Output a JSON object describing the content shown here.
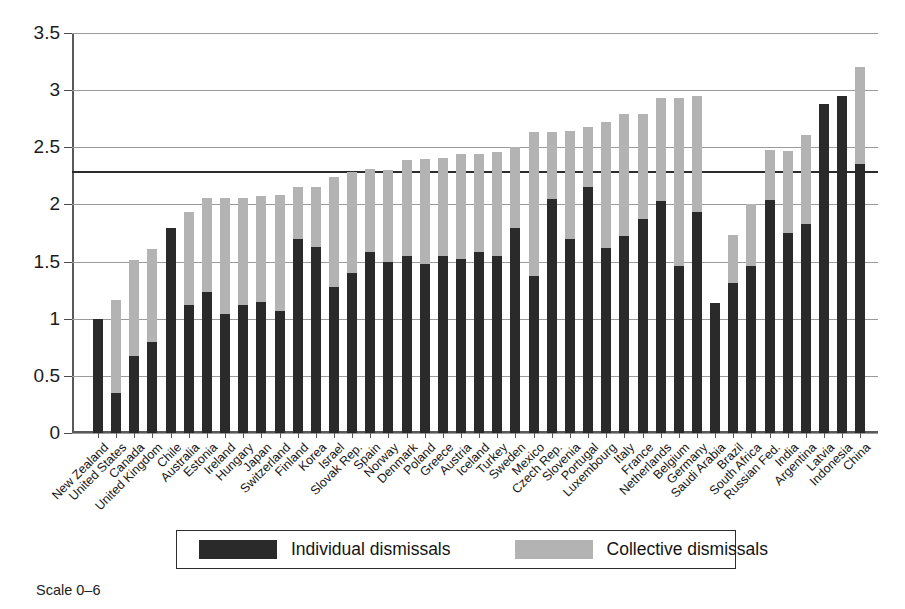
{
  "chart_data": {
    "type": "bar",
    "stacked": true,
    "title": "",
    "subtitle": "",
    "xlabel": "",
    "ylabel": "",
    "ylim": [
      0,
      3.5
    ],
    "yticks": [
      "0",
      "0.5",
      "1",
      "1.5",
      "2",
      "2.5",
      "3",
      "3.5"
    ],
    "ytick_values": [
      0,
      0.5,
      1,
      1.5,
      2,
      2.5,
      3,
      3.5
    ],
    "grid": true,
    "legend_position": "bottom",
    "reference_line": {
      "value": 2.29,
      "label": ""
    },
    "categories": [
      "New Zealand",
      "United States",
      "Canada",
      "United Kingdom",
      "Chile",
      "Australia",
      "Estonia",
      "Ireland",
      "Hungary",
      "Japan",
      "Switzerland",
      "Finland",
      "Korea",
      "Israel",
      "Slovak Rep.",
      "Spain",
      "Norway",
      "Denmark",
      "Poland",
      "Greece",
      "Austria",
      "Iceland",
      "Turkey",
      "Sweden",
      "Mexico",
      "Czech Rep.",
      "Slovenia",
      "Portugal",
      "Luxembourg",
      "Italy",
      "France",
      "Netherlands",
      "Belgium",
      "Germany",
      "Saudi Arabia",
      "Brazil",
      "South Africa",
      "Russian Fed.",
      "India",
      "Argentina",
      "Latvia",
      "Indonesia",
      "China"
    ],
    "series": [
      {
        "name": "Individual dismissals",
        "color": "#2a2a2a",
        "values": [
          1.0,
          0.35,
          0.67,
          0.8,
          1.79,
          1.12,
          1.23,
          1.04,
          1.12,
          1.15,
          1.07,
          1.7,
          1.63,
          1.28,
          1.4,
          1.58,
          1.5,
          1.55,
          1.48,
          1.55,
          1.52,
          1.58,
          1.55,
          1.79,
          1.37,
          2.05,
          1.7,
          2.15,
          1.62,
          1.72,
          1.87,
          2.03,
          1.46,
          1.93,
          1.14,
          1.31,
          1.46,
          2.04,
          1.75,
          1.83,
          2.88,
          2.95,
          2.35
        ]
      },
      {
        "name": "Collective dismissals",
        "color": "#b3b3b3",
        "values": [
          0.0,
          0.81,
          0.84,
          0.81,
          0.0,
          0.81,
          0.83,
          1.02,
          0.94,
          0.92,
          1.01,
          0.45,
          0.52,
          0.96,
          0.88,
          0.73,
          0.8,
          0.84,
          0.92,
          0.86,
          0.92,
          0.86,
          0.91,
          0.71,
          1.26,
          0.58,
          0.94,
          0.53,
          1.1,
          1.07,
          0.92,
          0.9,
          1.47,
          1.02,
          0.0,
          0.42,
          0.54,
          0.44,
          0.72,
          0.78,
          0.0,
          0.0,
          0.85
        ]
      }
    ],
    "totals": [
      1.0,
      1.16,
      1.51,
      1.61,
      1.79,
      1.93,
      2.06,
      2.06,
      2.06,
      2.07,
      2.08,
      2.15,
      2.15,
      2.24,
      2.28,
      2.31,
      2.3,
      2.39,
      2.4,
      2.41,
      2.44,
      2.44,
      2.46,
      2.5,
      2.63,
      2.63,
      2.64,
      2.68,
      2.72,
      2.79,
      2.79,
      2.93,
      2.93,
      2.95,
      1.14,
      1.73,
      2.0,
      2.48,
      2.47,
      2.61,
      2.88,
      2.95,
      3.2
    ]
  },
  "legend": {
    "individual_label": "Individual dismissals",
    "collective_label": "Collective dismissals"
  },
  "caption": {
    "scale_note": "Scale 0–6"
  }
}
